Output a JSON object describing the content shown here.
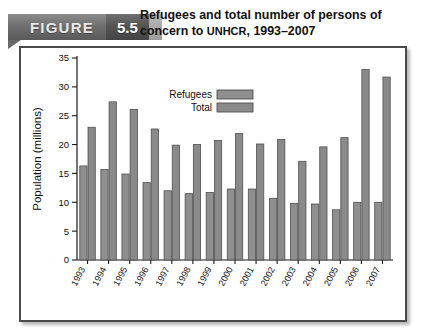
{
  "figure": {
    "banner_word": "FIGURE",
    "banner_number": "5.5",
    "title_line1": "Refugees and total number of persons of",
    "title_line2_pre": "concern to ",
    "title_line2_smallcaps": "UNHCR",
    "title_line2_post": ", 1993–2007",
    "title_full": "Refugees and total number of persons of concern to UNHCR, 1993–2007"
  },
  "colors": {
    "refugees_bar": "#8f8f8f",
    "total_bar": "#8a8a8a",
    "bar_outline": "#4f4f4f",
    "axis": "#1a1a1a",
    "frame_border": "#4a4a4a",
    "banner_gray": "#6f6f6f",
    "banner_dark": "#4e4e4e",
    "plot_background": "#ffffff"
  },
  "chart_data": {
    "type": "bar",
    "title": "Refugees and total number of persons of concern to UNHCR, 1993–2007",
    "xlabel": "",
    "ylabel": "Population (millions)",
    "ylim": [
      0,
      35
    ],
    "yticks": [
      0,
      5,
      10,
      15,
      20,
      25,
      30,
      35
    ],
    "ytick_labels": [
      "0",
      "5",
      "10",
      "15",
      "20",
      "25",
      "30",
      "35"
    ],
    "grid": false,
    "legend_position": "upper center",
    "categories": [
      "1993",
      "1994",
      "1995",
      "1996",
      "1997",
      "1998",
      "1999",
      "2000",
      "2001",
      "2002",
      "2003",
      "2004",
      "2005",
      "2006",
      "2007"
    ],
    "series": [
      {
        "name": "Refugees",
        "values": [
          16.3,
          15.7,
          14.9,
          13.4,
          12.0,
          11.5,
          11.7,
          12.3,
          12.3,
          10.7,
          9.8,
          9.7,
          8.7,
          10.0,
          10.0
        ]
      },
      {
        "name": "Total",
        "values": [
          23.0,
          27.4,
          26.1,
          22.7,
          19.9,
          20.0,
          20.7,
          21.9,
          20.1,
          20.9,
          17.1,
          19.6,
          21.2,
          33.0,
          31.7
        ]
      }
    ]
  }
}
